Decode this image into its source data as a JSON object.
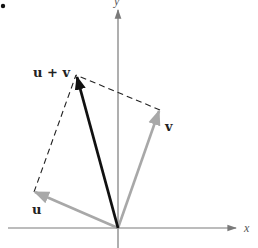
{
  "diagram": {
    "type": "vector-addition-parallelogram",
    "colors": {
      "axis": "#7a7a7a",
      "vector_u": "#a8a8a8",
      "vector_v": "#a8a8a8",
      "vector_sum": "#111111",
      "dashed": "#222222",
      "label": "#222222"
    },
    "axes": {
      "x_label": "x",
      "y_label": "y"
    },
    "vectors": {
      "u": {
        "label": "u"
      },
      "v": {
        "label": "v"
      },
      "sum": {
        "label": "u + v"
      }
    },
    "marker": "•"
  }
}
